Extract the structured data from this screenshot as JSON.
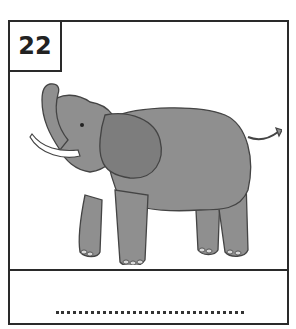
{
  "card": {
    "number": "22",
    "image": {
      "subject": "elephant",
      "colors": {
        "body": "#8f8f8f",
        "outline": "#444444",
        "tusk": "#ffffff"
      }
    },
    "answer": {
      "value": "",
      "placeholder": "......................."
    }
  }
}
